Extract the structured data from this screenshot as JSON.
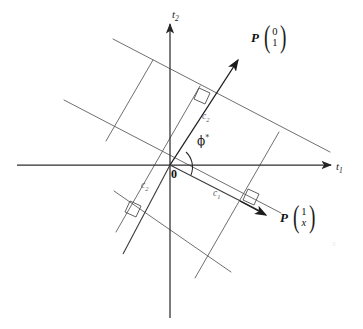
{
  "figure": {
    "background_color": "#ffffff",
    "line_color": "#4a4a4a",
    "axis_color": "#2e2e2e",
    "label_color": "#2b2b2b",
    "width": 363,
    "height": 329
  },
  "axes": {
    "horizontal": {
      "name": "t1",
      "label": "t",
      "subscript": "1",
      "direction": "right"
    },
    "vertical": {
      "name": "t2",
      "label": "t",
      "subscript": "2",
      "direction": "up"
    },
    "origin": {
      "label": "0",
      "x": 170,
      "y": 165
    }
  },
  "vectors": [
    {
      "name": "P-vector-upper",
      "prefix": "P",
      "components": [
        "0",
        "1"
      ],
      "components_italic": [
        false,
        false
      ],
      "tip_x": 244,
      "tip_y": 56,
      "label_x": 252,
      "label_y": 34,
      "angle_deg": 56
    },
    {
      "name": "P-vector-lower",
      "prefix": "P",
      "components": [
        "1",
        "x"
      ],
      "components_italic": [
        false,
        true
      ],
      "tip_x": 271,
      "tip_y": 226,
      "label_x": 281,
      "label_y": 214,
      "angle_deg": -27
    }
  ],
  "angle_marker": {
    "label": "ϕ",
    "superscript": "*",
    "x": 197,
    "y": 140,
    "description": "angle phi-star between the two P vectors at the origin"
  },
  "distance_labels": [
    {
      "name": "c2-upper",
      "label": "c",
      "subscript": "2",
      "x": 202,
      "y": 116
    },
    {
      "name": "c2-lower",
      "label": "c",
      "subscript": "2",
      "x": 143,
      "y": 184
    },
    {
      "name": "c1",
      "label": "c",
      "subscript": "1",
      "x": 213,
      "y": 192
    }
  ],
  "right_angle_markers": [
    {
      "name": "right-angle-upper",
      "x": 206,
      "y": 96
    },
    {
      "name": "right-angle-lower-left",
      "x": 137,
      "y": 207
    },
    {
      "name": "right-angle-lower-right",
      "x": 253,
      "y": 199
    }
  ],
  "line_families": [
    {
      "name": "family-perpendicular-to-upper-vector",
      "count": 3,
      "orientation": "shallow-negative-slope",
      "description": "three parallel lines perpendicular to P(0,1)"
    },
    {
      "name": "family-perpendicular-to-lower-vector",
      "count": 3,
      "orientation": "steep-positive-slope",
      "description": "three parallel lines perpendicular to P(1,x)"
    }
  ],
  "speck": {
    "name": "faint-artifact",
    "text": "x",
    "x": 333,
    "y": 244
  }
}
